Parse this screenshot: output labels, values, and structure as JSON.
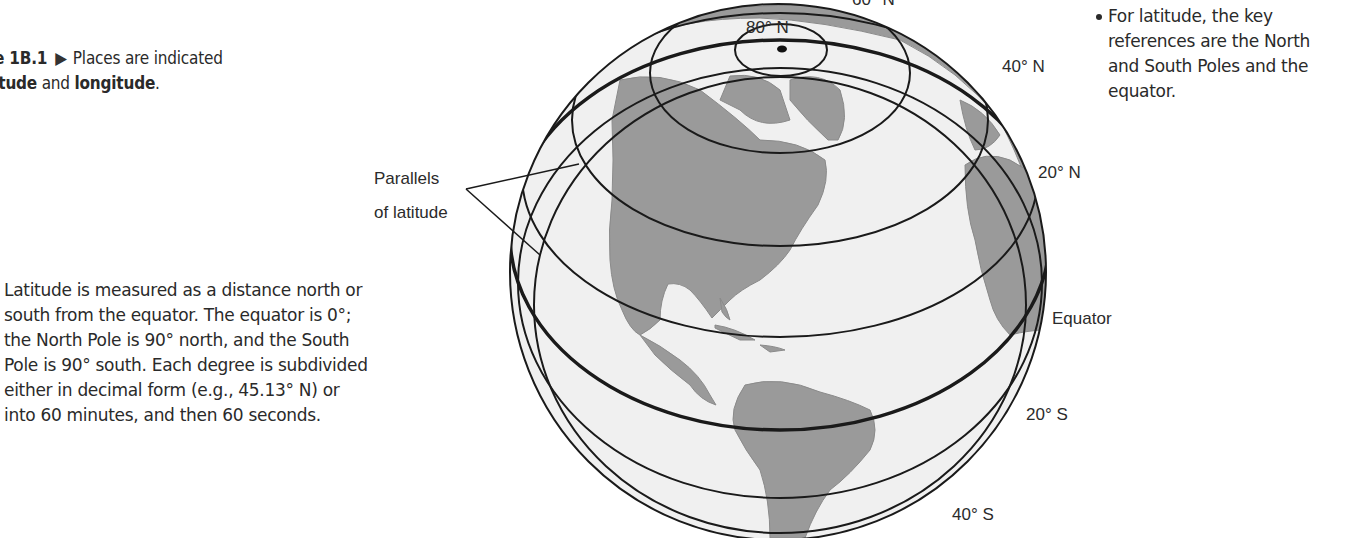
{
  "caption": {
    "figure_label": "ure 1B.1",
    "text": "Places are indicated",
    "line2_bold1": "atitude",
    "line2_mid": " and ",
    "line2_bold2": "longitude",
    "line2_end": "."
  },
  "body_text": "Latitude is measured as a distance north or south from the equator. The equator is 0°; the North Pole is 90° north, and the South Pole is 90° south. Each degree is subdivided either in decimal form (e.g., 45.13° N) or into 60 minutes, and then 60 seconds.",
  "body_lines": [
    "Latitude is measured as a distance north or",
    "south from the equator. The equator is 0°;",
    "the North Pole is 90° north, and the South",
    "Pole is 90° south. Each degree is subdivided",
    "either in decimal form (e.g., 45.13° N) or",
    "into 60 minutes, and then 60 seconds."
  ],
  "bullet": {
    "lines": [
      "For latitude, the key",
      "references are the North",
      "and South Poles and the",
      "equator."
    ]
  },
  "globe": {
    "callout": {
      "line1": "Parallels",
      "line2": "of latitude"
    },
    "labels": {
      "lat_60n": "60° N",
      "lat_80n": "80° N",
      "lat_40n": "40° N",
      "lat_20n": "20° N",
      "equator": "Equator",
      "lat_20s": "20° S",
      "lat_40s": "40° S"
    },
    "colors": {
      "ocean": "#f0f0f0",
      "land": "#999999",
      "line": "#1a1a1a"
    }
  }
}
